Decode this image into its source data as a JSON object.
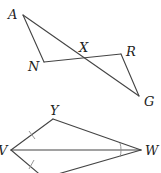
{
  "figure_top": {
    "points": {
      "A": {
        "label": "A",
        "x": 23,
        "y": 15
      },
      "N": {
        "label": "N",
        "x": 44,
        "y": 62
      },
      "X": {
        "label": "X",
        "x": 83,
        "y": 58
      },
      "R": {
        "label": "R",
        "x": 121,
        "y": 54
      },
      "G": {
        "label": "G",
        "x": 139,
        "y": 96
      }
    },
    "segments": [
      "AN",
      "NR",
      "RG",
      "AG"
    ]
  },
  "figure_bottom": {
    "points": {
      "Y": {
        "label": "Y",
        "x": 53,
        "y": 119
      },
      "V": {
        "label": "V",
        "x": 11,
        "y": 150
      },
      "W": {
        "label": "W",
        "x": 141,
        "y": 150
      },
      "Z": {
        "label": "",
        "x": 44,
        "y": 178
      }
    },
    "segments": [
      "VY",
      "YW",
      "VW",
      "VZ",
      "ZW"
    ],
    "markings": {
      "congruent_sides": [
        "VY",
        "VZ"
      ],
      "congruent_angles": [
        "YWV",
        "ZWV"
      ]
    }
  },
  "colors": {
    "line": "#444444",
    "mark": "#8a8a8a",
    "label": "#222222"
  }
}
